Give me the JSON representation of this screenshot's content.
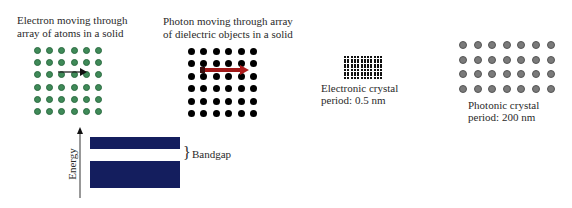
{
  "panels": {
    "electron": {
      "caption_line1": "Electron moving through",
      "caption_line2": "array of atoms in a solid",
      "grid": {
        "cols": 6,
        "rows": 6,
        "dot_color": "#3f8a58"
      },
      "arrow": {
        "color": "#222222",
        "row": 2
      }
    },
    "photon": {
      "caption_line1": "Photon moving through array",
      "caption_line2": "of dielectric objects in a solid",
      "grid": {
        "cols": 6,
        "rows": 6,
        "dot_color": "#000000"
      },
      "arrow": {
        "color": "#a01818",
        "row": 1
      }
    },
    "electronic_crystal": {
      "label_line1": "Electronic crystal",
      "label_line2": "period: 0.5 nm",
      "grid": {
        "cols": 12,
        "rows": 9,
        "dot_color": "#111111"
      }
    },
    "photonic_crystal": {
      "label_line1": "Photonic crystal",
      "label_line2": "period: 200 nm",
      "grid": {
        "cols": 7,
        "rows": 4,
        "dot_color": "#7a7a7a"
      }
    }
  },
  "band_diagram": {
    "axis_label": "Energy",
    "gap_label": "Bandgap",
    "band_color": "#141e5e",
    "brace": "}"
  }
}
